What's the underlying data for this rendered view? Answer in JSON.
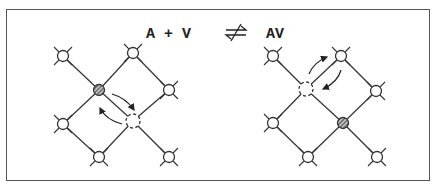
{
  "equation": {
    "left": "A + V",
    "arrow": "⇌",
    "right": "AV"
  },
  "colors": {
    "line": "#333333",
    "frame": "#555555",
    "background": "#ffffff"
  },
  "diagrams": [
    {
      "name": "separated",
      "sites": [
        {
          "x": 63,
          "y": 56,
          "type": "atom",
          "bonds": true
        },
        {
          "x": 133,
          "y": 53,
          "type": "atom",
          "bonds": true
        },
        {
          "x": 99,
          "y": 90,
          "type": "solute"
        },
        {
          "x": 169,
          "y": 90,
          "type": "atom",
          "bonds": true
        },
        {
          "x": 63,
          "y": 124,
          "type": "atom",
          "bonds": true
        },
        {
          "x": 133,
          "y": 121,
          "type": "vacancy"
        },
        {
          "x": 99,
          "y": 157,
          "type": "atom",
          "bonds": true
        },
        {
          "x": 169,
          "y": 157,
          "type": "atom",
          "bonds": true
        }
      ],
      "lines": [
        [
          0,
          2
        ],
        [
          2,
          5
        ],
        [
          5,
          7
        ],
        [
          1,
          2
        ],
        [
          2,
          4
        ],
        [
          1,
          3
        ],
        [
          3,
          5
        ],
        [
          5,
          6
        ],
        [
          4,
          6
        ]
      ],
      "arrows": [
        {
          "d": "M112,94 Q126,98 134,110"
        },
        {
          "d": "M122,124 Q106,120 100,108"
        }
      ]
    },
    {
      "name": "complex",
      "sites": [
        {
          "x": 273,
          "y": 56,
          "type": "atom",
          "bonds": true
        },
        {
          "x": 341,
          "y": 56,
          "type": "atom",
          "bonds": true
        },
        {
          "x": 306,
          "y": 89,
          "type": "vacancy"
        },
        {
          "x": 376,
          "y": 91,
          "type": "atom",
          "bonds": true
        },
        {
          "x": 273,
          "y": 123,
          "type": "atom",
          "bonds": true
        },
        {
          "x": 343,
          "y": 123,
          "type": "solute"
        },
        {
          "x": 308,
          "y": 157,
          "type": "atom",
          "bonds": true
        },
        {
          "x": 377,
          "y": 157,
          "type": "atom",
          "bonds": true
        }
      ],
      "lines": [
        [
          0,
          2
        ],
        [
          2,
          5
        ],
        [
          5,
          7
        ],
        [
          1,
          2
        ],
        [
          2,
          4
        ],
        [
          1,
          3
        ],
        [
          3,
          5
        ],
        [
          5,
          6
        ],
        [
          4,
          6
        ]
      ],
      "arrows": [
        {
          "d": "M309,74 Q314,62 327,57"
        },
        {
          "d": "M341,70 Q338,82 323,89"
        }
      ]
    }
  ]
}
